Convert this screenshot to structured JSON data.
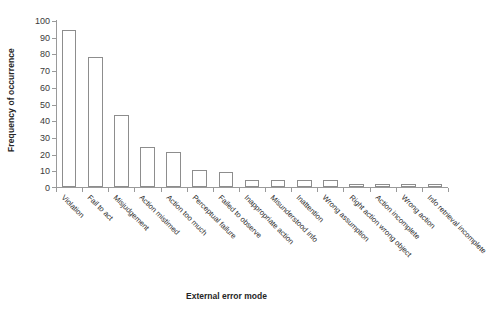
{
  "chart_data": {
    "type": "bar",
    "title": "",
    "xlabel": "External error mode",
    "ylabel": "Frequency of occurrence",
    "ylim": [
      0,
      100
    ],
    "yticks": [
      0,
      10,
      20,
      30,
      40,
      50,
      60,
      70,
      80,
      90,
      100
    ],
    "grid": false,
    "legend": null,
    "bar_style": {
      "fill": "#ffffff",
      "edge": "#8d8d8d"
    },
    "categories": [
      "Violation",
      "Fail to act",
      "Misjudgement",
      "Action mistimed",
      "Action too much",
      "Perceptual failure",
      "Failed to observe",
      "Inappropriate action",
      "Misunderstood info",
      "Inattention",
      "Wrong assumption",
      "Right action wrong object",
      "Action incomplete",
      "Wrong action",
      "Info retrieval incomplete"
    ],
    "values": [
      94,
      78,
      43,
      24,
      21,
      10,
      9,
      4,
      4,
      4,
      4,
      2,
      2,
      2,
      2
    ],
    "series": [
      {
        "name": "Frequency of occurrence",
        "values": [
          94,
          78,
          43,
          24,
          21,
          10,
          9,
          4,
          4,
          4,
          4,
          2,
          2,
          2,
          2
        ]
      }
    ]
  },
  "axes": {
    "y_title": "Frequency of occurrence",
    "x_title": "External error mode"
  }
}
